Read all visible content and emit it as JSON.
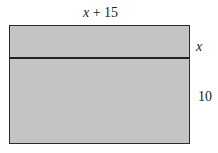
{
  "diagram": {
    "top_label_var": "x",
    "top_label_rest": " + 15",
    "right_top_label": "x",
    "right_bottom_label": "10",
    "colors": {
      "fill": "#c4c4c4",
      "stroke": "#222222"
    }
  }
}
